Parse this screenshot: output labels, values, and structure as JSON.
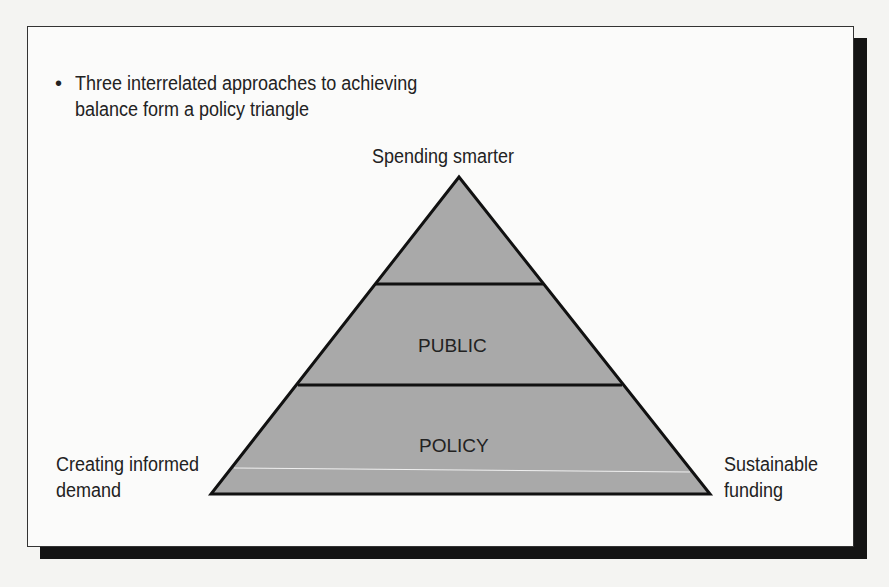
{
  "bullet": {
    "icon": "bullet-dot-icon",
    "text": "Three interrelated approaches to achieving balance form a policy triangle"
  },
  "triangle": {
    "apex_label": "Spending smarter",
    "left_label_line1": "Creating informed",
    "left_label_line2": "demand",
    "right_label_line1": "Sustainable",
    "right_label_line2": "funding",
    "band_labels": [
      "PUBLIC",
      "POLICY"
    ],
    "fill_color": "#a9a9a9",
    "stroke_color": "#111111"
  }
}
